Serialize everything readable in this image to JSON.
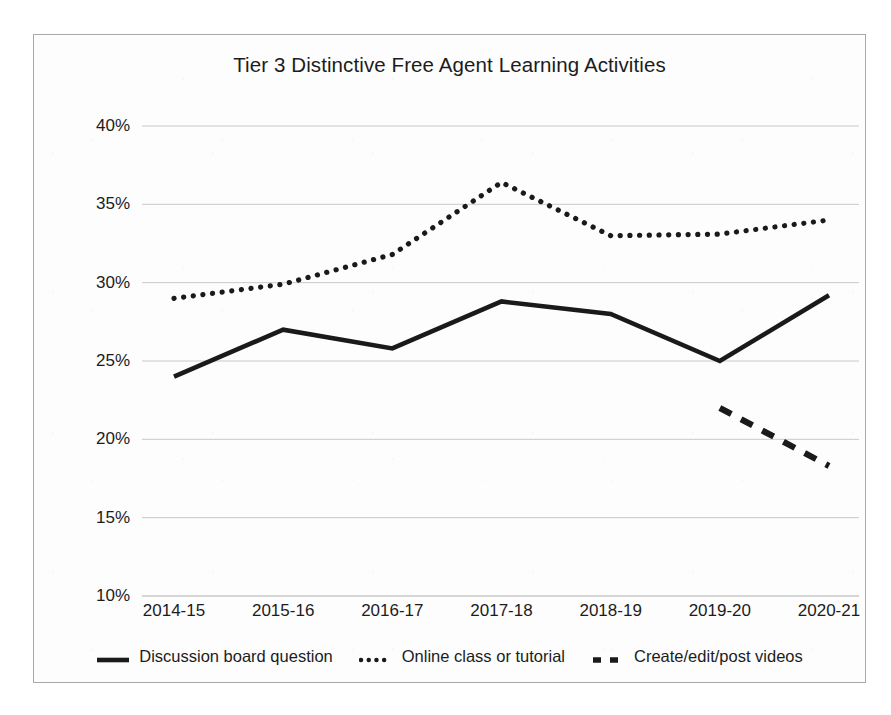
{
  "chart_data": {
    "type": "line",
    "title": "Tier 3 Distinctive Free Agent Learning Activities",
    "xlabel": "",
    "ylabel": "",
    "categories": [
      "2014-15",
      "2015-16",
      "2016-17",
      "2017-18",
      "2018-19",
      "2019-20",
      "2020-21"
    ],
    "ylim": [
      10,
      40
    ],
    "y_ticks": [
      "10%",
      "15%",
      "20%",
      "25%",
      "30%",
      "35%",
      "40%"
    ],
    "y_tick_values": [
      10,
      15,
      20,
      25,
      30,
      35,
      40
    ],
    "y_unit": "%",
    "grid": true,
    "legend_position": "bottom",
    "series": [
      {
        "name": "Discussion board question",
        "style": "solid",
        "color": "#1a1a1a",
        "values": [
          24.0,
          27.0,
          25.8,
          28.8,
          28.0,
          25.0,
          29.2
        ]
      },
      {
        "name": "Online class or tutorial",
        "style": "dotted",
        "color": "#1a1a1a",
        "values": [
          29.0,
          29.9,
          31.8,
          36.4,
          33.0,
          33.1,
          34.0
        ]
      },
      {
        "name": "Create/edit/post videos",
        "style": "dashed",
        "color": "#1a1a1a",
        "values": [
          null,
          null,
          null,
          null,
          null,
          22.0,
          18.3
        ]
      }
    ]
  },
  "legend": {
    "items": [
      {
        "label": "Discussion board question",
        "style": "solid"
      },
      {
        "label": "Online class or tutorial",
        "style": "dotted"
      },
      {
        "label": "Create/edit/post videos",
        "style": "dashed"
      }
    ]
  },
  "colors": {
    "ink": "#1a1a1a",
    "gridline": "#c9c9c9",
    "border": "#a9a9a9",
    "background": "#fdfdfd"
  }
}
